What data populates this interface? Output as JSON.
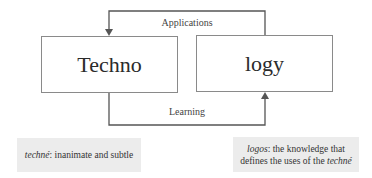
{
  "diagram": {
    "nodes": [
      {
        "id": "techno",
        "label": "Techno"
      },
      {
        "id": "logy",
        "label": "logy"
      }
    ],
    "edges": [
      {
        "from": "logy",
        "to": "techno",
        "label": "Applications",
        "route": "top"
      },
      {
        "from": "techno",
        "to": "logy",
        "label": "Learning",
        "route": "bottom"
      }
    ],
    "notes": {
      "left": {
        "term": "techné",
        "text": ": inanimate and subtle"
      },
      "right": {
        "term": "logos",
        "text_line1": ": the knowledge that",
        "text_line2": "defines the uses of the ",
        "term2": "techné"
      }
    }
  },
  "colors": {
    "line": "#555555",
    "box_border": "#8a8a8a",
    "note_bg": "#ececec"
  }
}
